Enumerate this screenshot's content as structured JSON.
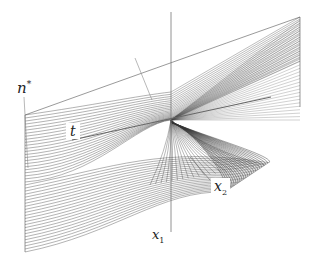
{
  "figure": {
    "labels": {
      "n_star": {
        "base": "n",
        "sup": "*"
      },
      "t": {
        "base": "t"
      },
      "x1": {
        "base": "x",
        "sub": "1"
      },
      "x2": {
        "base": "x",
        "sub": "2"
      }
    },
    "colors": {
      "background": "#ffffff",
      "surface_lines": "#555555",
      "dense_region": "#222222",
      "axis_line": "#777777",
      "label_text": "#222222"
    },
    "geometry": {
      "axis_x": 171,
      "axis_top": 12,
      "axis_bottom": 232,
      "cusp": [
        171,
        120
      ],
      "left_edge_x": 25,
      "left_edge_top": 115,
      "left_edge_bottom": 252,
      "right_edge_x": 300,
      "right_edge_top": 17,
      "right_edge_bottom": 107,
      "lobe_tip": [
        270,
        170
      ],
      "line_count": 46
    }
  }
}
